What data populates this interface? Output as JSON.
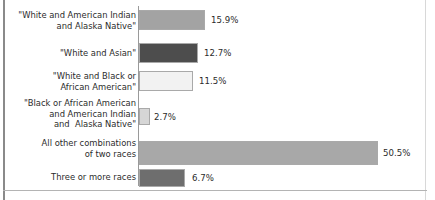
{
  "chart_data": {
    "type": "bar",
    "orientation": "horizontal",
    "title": "",
    "subtitle": "",
    "xlabel": "",
    "ylabel": "",
    "grid": false,
    "legend": null,
    "xlim": [
      0,
      55
    ],
    "value_suffix": "%",
    "categories": [
      "\"White and American Indian\nand Alaska Native\"",
      "\"White and Asian\"",
      "\"White and Black or\nAfrican American\"",
      "\"Black or African American\nand American Indian\nand  Alaska Native\"",
      "All other combinations\nof two races",
      "Three or more races"
    ],
    "values": [
      15.9,
      12.7,
      11.5,
      2.7,
      50.5,
      6.7
    ],
    "value_labels": [
      "15.9%",
      "12.7%",
      "11.5%",
      "2.7%",
      "50.5%",
      "6.7%"
    ],
    "bar_colors": [
      "#a3a3a3",
      "#4d4d4d",
      "#f2f2f2",
      "#d6d6d6",
      "#a8a8a8",
      "#6e6e6e"
    ],
    "bar_border_color": "#a9a9a9",
    "axis_color": "#9a9a9a",
    "text_color": "#2b2b2b",
    "background_color": "#ffffff",
    "bars": [
      {
        "label": "\"White and American Indian\nand Alaska Native\"",
        "value": 15.9,
        "value_label": "15.9%",
        "color": "#a3a3a3",
        "top": 10,
        "height": 20,
        "width": 66,
        "label_top": 10,
        "value_left": 211
      },
      {
        "label": "\"White and Asian\"",
        "value": 12.7,
        "value_label": "12.7%",
        "color": "#4d4d4d",
        "top": 43,
        "height": 20,
        "width": 59,
        "label_top": 48,
        "value_left": 204
      },
      {
        "label": "\"White and Black or\nAfrican American\"",
        "value": 11.5,
        "value_label": "11.5%",
        "color": "#f2f2f2",
        "top": 71,
        "height": 20,
        "width": 54,
        "label_top": 71,
        "value_left": 199
      },
      {
        "label": "\"Black or African American\nand American Indian\nand  Alaska Native\"",
        "value": 2.7,
        "value_label": "2.7%",
        "color": "#d6d6d6",
        "top": 108,
        "height": 17,
        "width": 11,
        "label_top": 98,
        "value_left": 154
      },
      {
        "label": "All other combinations\nof two races",
        "value": 50.5,
        "value_label": "50.5%",
        "color": "#a8a8a8",
        "top": 141,
        "height": 24,
        "width": 239,
        "label_top": 138,
        "value_left": 383
      },
      {
        "label": "Three or more races",
        "value": 6.7,
        "value_label": "6.7%",
        "color": "#6e6e6e",
        "top": 169,
        "height": 18,
        "width": 46,
        "label_top": 172,
        "value_left": 192
      }
    ]
  }
}
